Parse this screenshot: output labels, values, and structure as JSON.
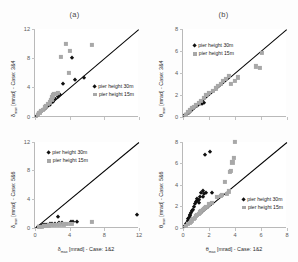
{
  "figure": {
    "background": "#fdfdfd",
    "series_colors": {
      "pier30": "#101010",
      "pier15": "#a8a8a8",
      "refline": "#000000"
    }
  },
  "panels": {
    "a": {
      "title": "(a)"
    },
    "b": {
      "title": "(b)"
    }
  },
  "legend": {
    "pier30_label": "pier height 30m",
    "pier15_label": "pier height 15m"
  },
  "chart_data": [
    {
      "id": "a-top",
      "type": "scatter",
      "title": "(a)",
      "xlabel": "δmax [mrad] - Case: 1&2",
      "ylabel": "δmax [mrad] - Case: 3&4",
      "xlim": [
        0,
        12
      ],
      "ylim": [
        0,
        12
      ],
      "xticks": [
        0,
        4,
        8,
        12
      ],
      "yticks": [
        0,
        4,
        8,
        12
      ],
      "grid": false,
      "reference_line": {
        "type": "1:1",
        "from": [
          0,
          0
        ],
        "to": [
          12,
          12
        ]
      },
      "series": [
        {
          "name": "pier height 30m",
          "marker": "diamond",
          "color": "#101010",
          "points": [
            [
              0.2,
              0.2
            ],
            [
              0.35,
              0.4
            ],
            [
              0.5,
              0.55
            ],
            [
              0.7,
              0.75
            ],
            [
              0.9,
              0.95
            ],
            [
              1.1,
              1.15
            ],
            [
              1.3,
              1.2
            ],
            [
              1.5,
              1.5
            ],
            [
              1.7,
              1.6
            ],
            [
              1.9,
              1.9
            ],
            [
              2.1,
              2.0
            ],
            [
              2.3,
              2.5
            ],
            [
              2.6,
              2.7
            ],
            [
              2.9,
              3.0
            ],
            [
              3.2,
              4.5
            ],
            [
              4.3,
              8.0
            ],
            [
              4.6,
              5.0
            ],
            [
              5.6,
              5.3
            ]
          ]
        },
        {
          "name": "pier height 15m",
          "marker": "square",
          "color": "#a8a8a8",
          "points": [
            [
              0.3,
              0.3
            ],
            [
              0.5,
              0.6
            ],
            [
              0.7,
              0.8
            ],
            [
              0.9,
              1.0
            ],
            [
              1.1,
              1.3
            ],
            [
              1.3,
              1.5
            ],
            [
              1.5,
              1.8
            ],
            [
              1.7,
              2.0
            ],
            [
              1.9,
              2.3
            ],
            [
              2.0,
              2.7
            ],
            [
              2.1,
              3.0
            ],
            [
              2.2,
              3.1
            ],
            [
              2.4,
              3.2
            ],
            [
              2.6,
              3.3
            ],
            [
              3.0,
              8.2
            ],
            [
              3.6,
              10.0
            ],
            [
              3.9,
              6.0
            ],
            [
              4.0,
              9.0
            ],
            [
              6.6,
              9.8
            ]
          ]
        }
      ]
    },
    {
      "id": "a-bottom",
      "type": "scatter",
      "title": "",
      "xlabel": "δmax [mrad] - Case: 1&2",
      "ylabel": "δmax [mrad] - Case: 5&6",
      "xlim": [
        0,
        12
      ],
      "ylim": [
        0,
        12
      ],
      "xticks": [
        0,
        4,
        8,
        12
      ],
      "yticks": [
        0,
        4,
        8,
        12
      ],
      "grid": false,
      "reference_line": {
        "type": "1:1",
        "from": [
          0,
          0
        ],
        "to": [
          12,
          12
        ]
      },
      "series": [
        {
          "name": "pier height 30m",
          "marker": "diamond",
          "color": "#101010",
          "points": [
            [
              0.4,
              0.2
            ],
            [
              0.7,
              0.3
            ],
            [
              0.9,
              0.35
            ],
            [
              1.2,
              0.4
            ],
            [
              1.4,
              0.45
            ],
            [
              1.7,
              0.5
            ],
            [
              2.0,
              0.55
            ],
            [
              2.3,
              0.6
            ],
            [
              2.6,
              1.5
            ],
            [
              2.8,
              0.7
            ],
            [
              3.1,
              0.75
            ],
            [
              4.1,
              0.8
            ],
            [
              4.4,
              0.8
            ],
            [
              4.8,
              0.85
            ],
            [
              11.8,
              1.75
            ]
          ]
        },
        {
          "name": "pier height 15m",
          "marker": "square",
          "color": "#a8a8a8",
          "points": [
            [
              0.5,
              0.15
            ],
            [
              0.8,
              0.2
            ],
            [
              1.0,
              0.25
            ],
            [
              1.3,
              0.3
            ],
            [
              1.6,
              0.35
            ],
            [
              1.9,
              0.4
            ],
            [
              2.2,
              0.45
            ],
            [
              2.5,
              0.45
            ],
            [
              2.9,
              0.5
            ],
            [
              3.3,
              0.5
            ],
            [
              3.7,
              0.55
            ],
            [
              4.2,
              0.6
            ],
            [
              6.6,
              0.8
            ]
          ]
        }
      ]
    },
    {
      "id": "b-top",
      "type": "scatter",
      "title": "(b)",
      "xlabel": "θmax [mrad] - Case: 1&2",
      "ylabel": "θmax [mrad] - Case: 3&4",
      "xlim": [
        0,
        8
      ],
      "ylim": [
        0,
        8
      ],
      "xticks": [
        0,
        2,
        4,
        6,
        8
      ],
      "yticks": [
        0,
        2,
        4,
        6,
        8
      ],
      "grid": false,
      "reference_line": {
        "type": "1:1",
        "from": [
          0,
          0
        ],
        "to": [
          8,
          8
        ]
      },
      "series": [
        {
          "name": "pier height 30m",
          "marker": "diamond",
          "color": "#101010",
          "points": [
            [
              0.15,
              0.15
            ],
            [
              0.3,
              0.3
            ],
            [
              0.45,
              0.4
            ],
            [
              0.6,
              0.55
            ],
            [
              0.75,
              0.7
            ],
            [
              0.85,
              0.8
            ],
            [
              0.95,
              0.9
            ],
            [
              1.05,
              1.0
            ],
            [
              1.15,
              1.05
            ],
            [
              1.3,
              1.15
            ],
            [
              1.45,
              1.2
            ],
            [
              1.6,
              1.25
            ]
          ]
        },
        {
          "name": "pier height 15m",
          "marker": "square",
          "color": "#a8a8a8",
          "points": [
            [
              0.2,
              0.2
            ],
            [
              0.4,
              0.45
            ],
            [
              0.55,
              0.6
            ],
            [
              0.7,
              0.8
            ],
            [
              0.85,
              0.95
            ],
            [
              1.0,
              1.1
            ],
            [
              1.2,
              1.3
            ],
            [
              1.4,
              1.5
            ],
            [
              1.6,
              1.7
            ],
            [
              1.8,
              2.0
            ],
            [
              2.0,
              2.2
            ],
            [
              2.3,
              2.4
            ],
            [
              2.5,
              2.6
            ],
            [
              2.7,
              2.8
            ],
            [
              2.9,
              3.0
            ],
            [
              3.1,
              3.3
            ],
            [
              3.3,
              3.5
            ],
            [
              3.5,
              3.7
            ],
            [
              3.7,
              3.0
            ],
            [
              4.0,
              3.3
            ],
            [
              4.2,
              3.6
            ],
            [
              5.9,
              4.5
            ],
            [
              6.1,
              5.8
            ],
            [
              5.6,
              4.6
            ]
          ]
        }
      ]
    },
    {
      "id": "b-bottom",
      "type": "scatter",
      "title": "",
      "xlabel": "θmax [mrad] - Case: 1&2",
      "ylabel": "θmax [mrad] - Case: 5&6",
      "xlim": [
        0,
        8
      ],
      "ylim": [
        0,
        8
      ],
      "xticks": [
        0,
        2,
        4,
        6,
        8
      ],
      "yticks": [
        0,
        2,
        4,
        6,
        8
      ],
      "grid": false,
      "reference_line": {
        "type": "1:1",
        "from": [
          0,
          0
        ],
        "to": [
          8,
          8
        ]
      },
      "series": [
        {
          "name": "pier height 30m",
          "marker": "diamond",
          "color": "#101010",
          "points": [
            [
              0.15,
              0.2
            ],
            [
              0.25,
              0.35
            ],
            [
              0.3,
              0.5
            ],
            [
              0.35,
              0.65
            ],
            [
              0.4,
              0.8
            ],
            [
              0.45,
              0.95
            ],
            [
              0.5,
              1.1
            ],
            [
              0.55,
              1.25
            ],
            [
              0.6,
              1.4
            ],
            [
              0.7,
              1.55
            ],
            [
              0.8,
              1.7
            ],
            [
              0.85,
              2.0
            ],
            [
              0.9,
              2.2
            ],
            [
              1.0,
              2.4
            ],
            [
              1.05,
              2.55
            ],
            [
              1.1,
              2.7
            ],
            [
              1.2,
              2.3
            ],
            [
              1.25,
              2.6
            ],
            [
              1.3,
              2.85
            ],
            [
              1.4,
              3.3
            ],
            [
              1.5,
              3.4
            ],
            [
              1.55,
              2.9
            ],
            [
              1.6,
              3.2
            ],
            [
              1.7,
              6.8
            ],
            [
              1.8,
              3.3
            ],
            [
              2.1,
              7.1
            ],
            [
              2.2,
              3.3
            ]
          ]
        },
        {
          "name": "pier height 15m",
          "marker": "square",
          "color": "#a8a8a8",
          "points": [
            [
              0.2,
              0.2
            ],
            [
              0.35,
              0.35
            ],
            [
              0.5,
              0.5
            ],
            [
              0.6,
              0.6
            ],
            [
              0.7,
              0.7
            ],
            [
              0.8,
              0.85
            ],
            [
              0.9,
              0.95
            ],
            [
              1.0,
              1.1
            ],
            [
              1.1,
              1.2
            ],
            [
              1.2,
              1.3
            ],
            [
              1.3,
              1.45
            ],
            [
              1.4,
              1.55
            ],
            [
              1.5,
              1.7
            ],
            [
              1.6,
              1.8
            ],
            [
              1.7,
              1.9
            ],
            [
              1.8,
              2.0
            ],
            [
              2.0,
              2.2
            ],
            [
              2.2,
              2.3
            ],
            [
              2.6,
              2.9
            ],
            [
              2.9,
              3.0
            ],
            [
              3.0,
              3.1
            ],
            [
              3.2,
              4.3
            ],
            [
              3.4,
              3.2
            ],
            [
              3.6,
              5.2
            ],
            [
              3.7,
              5.3
            ],
            [
              3.8,
              6.1
            ],
            [
              3.9,
              6.5
            ],
            [
              4.0,
              8.0
            ],
            [
              3.5,
              3.4
            ]
          ]
        }
      ]
    }
  ]
}
